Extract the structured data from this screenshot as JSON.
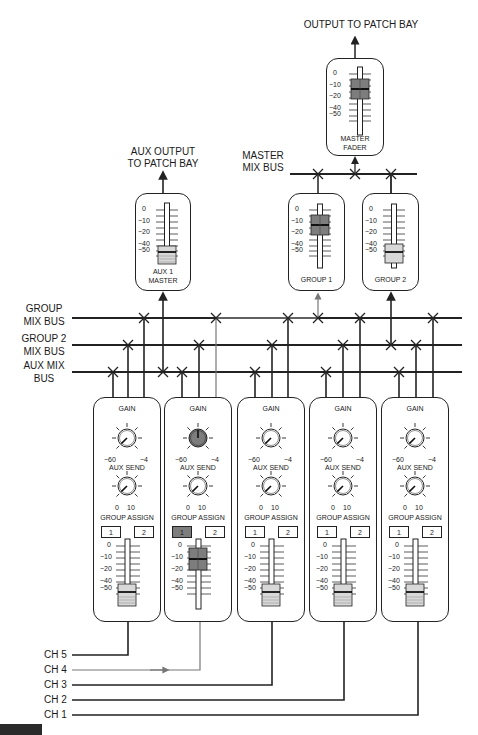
{
  "title": "OUTPUT TO PATCH BAY",
  "master_fader": {
    "label_line1": "MASTER",
    "label_line2": "FADER",
    "scale": [
      "0",
      "−10",
      "−20",
      "−40",
      "−50"
    ],
    "position_db": -15
  },
  "master_mix_bus": {
    "line1": "MASTER",
    "line2": "MIX BUS"
  },
  "aux_output": {
    "line1": "AUX OUTPUT",
    "line2": "TO PATCH BAY"
  },
  "aux1_master": {
    "label_line1": "AUX 1",
    "label_line2": "MASTER",
    "scale": [
      "0",
      "−10",
      "−20",
      "−40",
      "−50"
    ],
    "position_db": -55
  },
  "groups": [
    {
      "label": "GROUP 1",
      "scale": [
        "0",
        "−10",
        "−20",
        "−40",
        "−50"
      ],
      "position_db": -15,
      "active": true
    },
    {
      "label": "GROUP 2",
      "scale": [
        "0",
        "−10",
        "−20",
        "−40",
        "−50"
      ],
      "position_db": -55,
      "active": false
    }
  ],
  "buses": {
    "group_mix": {
      "line1": "GROUP",
      "line2": "MIX BUS"
    },
    "group2_mix": {
      "line1": "GROUP 2",
      "line2": "MIX BUS"
    },
    "aux_mix": {
      "line1": "AUX MIX",
      "line2": "BUS"
    }
  },
  "strip_labels": {
    "gain": "GAIN",
    "gain_min": "−60",
    "gain_max": "−4",
    "aux_send": "AUX SEND",
    "aux_min": "0",
    "aux_max": "10",
    "group_assign": "GROUP ASSIGN",
    "assign_1": "1",
    "assign_2": "2",
    "scale": [
      "0",
      "−10",
      "−20",
      "−40",
      "−50"
    ]
  },
  "channels": [
    {
      "name": "CH 5",
      "gain_active": false,
      "assign1": false,
      "fader_active": false
    },
    {
      "name": "CH 4",
      "gain_active": true,
      "assign1": true,
      "fader_active": true
    },
    {
      "name": "CH 3",
      "gain_active": false,
      "assign1": false,
      "fader_active": false
    },
    {
      "name": "CH 2",
      "gain_active": false,
      "assign1": false,
      "fader_active": false
    },
    {
      "name": "CH 1",
      "gain_active": false,
      "assign1": false,
      "fader_active": false
    }
  ],
  "input_labels": [
    "CH 5",
    "CH 4",
    "CH 3",
    "CH 2",
    "CH 1"
  ],
  "colors": {
    "line": "#222222",
    "signal_path": "#777777",
    "active_fill": "#7d7d7d",
    "fader_cap": "#d8d8d8"
  }
}
